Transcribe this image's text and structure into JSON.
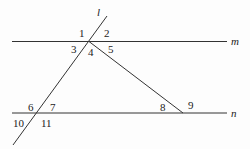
{
  "diagram": {
    "type": "geometry-parallel-lines-transversals",
    "lines": {
      "m": {
        "label": "m",
        "x1": 12,
        "y1": 41.5,
        "x2": 227,
        "y2": 41.5
      },
      "n": {
        "label": "n",
        "x1": 12,
        "y1": 113,
        "x2": 227,
        "y2": 113
      },
      "l": {
        "label": "l",
        "x1": 107,
        "y1": 16,
        "x2": 13,
        "y2": 145
      },
      "t": {
        "label": "",
        "x1": 89,
        "y1": 41.5,
        "x2": 183,
        "y2": 113
      }
    },
    "line_labels": [
      {
        "text": "l",
        "x": 97,
        "y": 16
      },
      {
        "text": "m",
        "x": 231,
        "y": 45
      },
      {
        "text": "n",
        "x": 231,
        "y": 117
      }
    ],
    "angle_labels": [
      {
        "text": "1",
        "x": 79,
        "y": 37
      },
      {
        "text": "2",
        "x": 104,
        "y": 37
      },
      {
        "text": "3",
        "x": 71,
        "y": 53
      },
      {
        "text": "4",
        "x": 88,
        "y": 56
      },
      {
        "text": "5",
        "x": 108,
        "y": 53
      },
      {
        "text": "6",
        "x": 28,
        "y": 111
      },
      {
        "text": "7",
        "x": 50,
        "y": 111
      },
      {
        "text": "8",
        "x": 160,
        "y": 111
      },
      {
        "text": "9",
        "x": 188,
        "y": 109
      },
      {
        "text": "10",
        "x": 13,
        "y": 127
      },
      {
        "text": "11",
        "x": 41,
        "y": 127
      }
    ]
  }
}
